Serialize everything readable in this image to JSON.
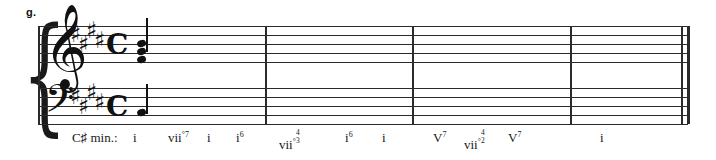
{
  "exercise": {
    "label": "g."
  },
  "score": {
    "key_signature": "4 sharps",
    "key_name": "C# minor",
    "time_signature": "common-time",
    "time_signature_glyph": "C",
    "clefs": {
      "treble": "𝄞",
      "bass": "𝄢"
    },
    "brace_glyph": "{",
    "sharp_glyph": "♯",
    "staves": [
      {
        "name": "treble-staff",
        "clef": "treble"
      },
      {
        "name": "bass-staff",
        "clef": "bass"
      }
    ],
    "measures": 4,
    "notes": {
      "treble_chord": "three-note chord with upward stem",
      "bass_note": "quarter note with upward stem"
    }
  },
  "analysis": {
    "key_label": "C♯ min.:",
    "items": [
      {
        "x": 133,
        "numeral": "i",
        "sup": "",
        "dim": "",
        "figure_top": "",
        "figure_bottom": ""
      },
      {
        "x": 168,
        "numeral": "vii",
        "sup": "7",
        "dim": "°",
        "figure_top": "",
        "figure_bottom": ""
      },
      {
        "x": 207,
        "numeral": "i",
        "sup": "",
        "dim": "",
        "figure_top": "",
        "figure_bottom": ""
      },
      {
        "x": 236,
        "numeral": "i",
        "sup": "6",
        "dim": "",
        "figure_top": "",
        "figure_bottom": ""
      },
      {
        "x": 279,
        "numeral": "vii",
        "sup": "",
        "dim": "°",
        "figure_top": "4",
        "figure_bottom": "3"
      },
      {
        "x": 345,
        "numeral": "i",
        "sup": "6",
        "dim": "",
        "figure_top": "",
        "figure_bottom": ""
      },
      {
        "x": 382,
        "numeral": "i",
        "sup": "",
        "dim": "",
        "figure_top": "",
        "figure_bottom": ""
      },
      {
        "x": 433,
        "numeral": "V",
        "sup": "7",
        "dim": "",
        "figure_top": "",
        "figure_bottom": ""
      },
      {
        "x": 464,
        "numeral": "vii",
        "sup": "",
        "dim": "°",
        "figure_top": "4",
        "figure_bottom": "2"
      },
      {
        "x": 508,
        "numeral": "V",
        "sup": "7",
        "dim": "",
        "figure_top": "",
        "figure_bottom": ""
      },
      {
        "x": 600,
        "numeral": "i",
        "sup": "",
        "dim": "",
        "figure_top": "",
        "figure_bottom": ""
      }
    ]
  },
  "layout": {
    "barlines": [
      38,
      265,
      412,
      570
    ],
    "final_barline": [
      682,
      688
    ],
    "key_sharps_treble": [
      {
        "x": 70,
        "y": 23
      },
      {
        "x": 78,
        "y": 33
      },
      {
        "x": 86,
        "y": 19
      },
      {
        "x": 94,
        "y": 29
      }
    ],
    "key_sharps_bass": [
      {
        "x": 70,
        "y": 86
      },
      {
        "x": 78,
        "y": 96
      },
      {
        "x": 86,
        "y": 82
      },
      {
        "x": 94,
        "y": 92
      }
    ]
  },
  "colors": {
    "ink": "#1a1a1a",
    "staff": "#2b2b2b",
    "background": "#ffffff"
  }
}
